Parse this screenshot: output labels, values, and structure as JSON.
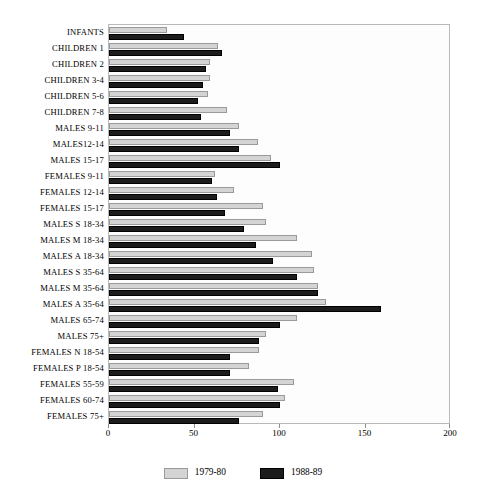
{
  "chart_data": {
    "type": "bar",
    "orientation": "horizontal",
    "title": "",
    "xlabel": "",
    "ylabel": "",
    "xlim": [
      0,
      200
    ],
    "xticks": [
      0,
      50,
      100,
      150,
      200
    ],
    "grid": false,
    "legend_position": "bottom-center",
    "categories": [
      "INFANTS",
      "CHILDREN 1",
      "CHILDREN 2",
      "CHILDREN 3-4",
      "CHILDREN 5-6",
      "CHILDREN 7-8",
      "MALES 9-11",
      "MALES12-14",
      "MALES 15-17",
      "FEMALES 9-11",
      "FEMALES 12-14",
      "FEMALES 15-17",
      "MALES S 18-34",
      "MALES M 18-34",
      "MALES A 18-34",
      "MALES S 35-64",
      "MALES M 35-64",
      "MALES A 35-64",
      "MALES 65-74",
      "MALES 75+",
      "FEMALES N 18-54",
      "FEMALES P 18-54",
      "FEMALES 55-59",
      "FEMALES 60-74",
      "FEMALES 75+"
    ],
    "series": [
      {
        "name": "1979-80",
        "color": "#d4d4d4",
        "values": [
          34,
          64,
          59,
          59,
          58,
          69,
          76,
          87,
          95,
          62,
          73,
          90,
          92,
          110,
          119,
          120,
          122,
          127,
          110,
          92,
          88,
          82,
          108,
          103,
          90
        ]
      },
      {
        "name": "1988-89",
        "color": "#1c1c1c",
        "values": [
          44,
          66,
          57,
          55,
          52,
          54,
          71,
          76,
          100,
          60,
          63,
          68,
          79,
          86,
          96,
          110,
          122,
          159,
          100,
          88,
          71,
          71,
          99,
          100,
          76
        ]
      }
    ]
  },
  "axis": {
    "tick_labels": [
      "0",
      "50",
      "100",
      "150",
      "200"
    ]
  },
  "legend": {
    "entries": [
      {
        "label": "1979-80"
      },
      {
        "label": "1988-89"
      }
    ]
  }
}
